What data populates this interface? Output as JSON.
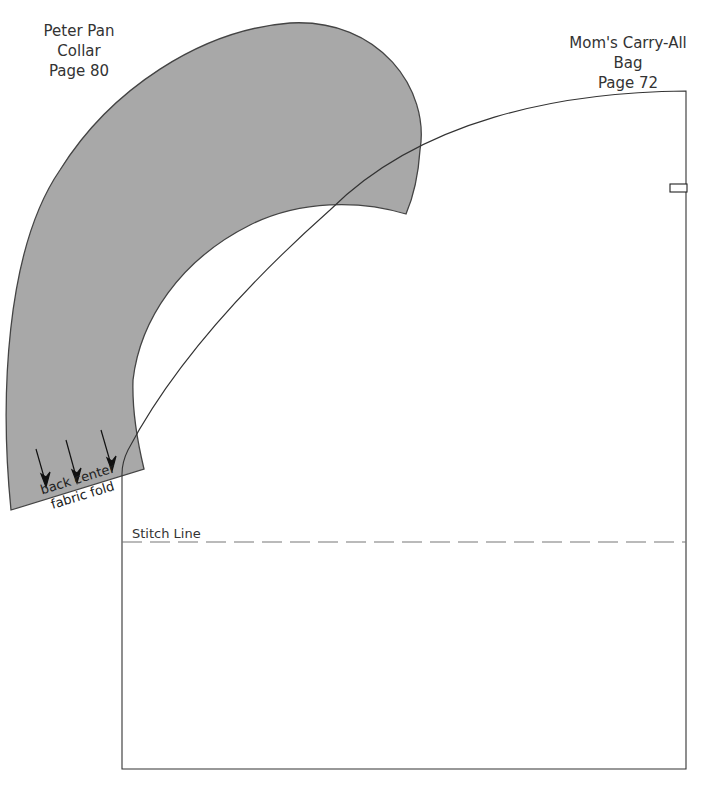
{
  "patterns": {
    "collar": {
      "title_lines": [
        "Peter Pan",
        "Collar",
        "Page 80"
      ],
      "fold_lines": [
        "back center",
        "fabric fold"
      ],
      "fill": "#a8a8a8",
      "stroke": "#444444"
    },
    "bag": {
      "title_lines": [
        "Mom's Carry-All",
        "Bag",
        "Page 72"
      ],
      "stitch_label": "Stitch Line",
      "stroke": "#333333",
      "stitch_color": "#777777"
    }
  }
}
